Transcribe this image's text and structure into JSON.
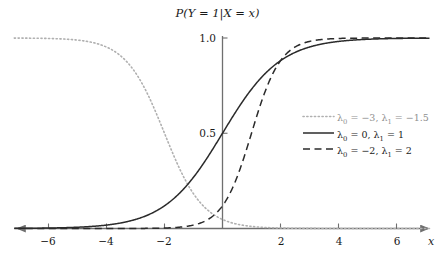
{
  "chart_data": {
    "type": "line",
    "title": "P(Y = 1|X = x)",
    "xlabel": "x",
    "ylabel": "",
    "xlim": [
      -7.2,
      7.2
    ],
    "ylim": [
      0,
      1.0
    ],
    "xticks": [
      -6,
      -4,
      -2,
      2,
      4,
      6
    ],
    "xtick_labels": [
      "−6",
      "−4",
      "−2",
      "2",
      "4",
      "6"
    ],
    "yticks": [
      0.5,
      1.0
    ],
    "ytick_labels": [
      "0.5",
      "1.0"
    ],
    "grid": false,
    "legend_position": "center-right",
    "series": [
      {
        "name": "lambda0 = -3, lambda1 = -1.5",
        "label_l0": "λ",
        "label_l0_sub": "0",
        "label_l0_val": " = −3,",
        "label_l1": "λ",
        "label_l1_sub": "1",
        "label_l1_val": " = −1.5",
        "lambda0": -3,
        "lambda1": -1.5,
        "style": "dotted",
        "color": "#b0b0b0",
        "midpoint_x": -2
      },
      {
        "name": "lambda0 = 0, lambda1 = 1",
        "label_l0": "λ",
        "label_l0_sub": "0",
        "label_l0_val": " = 0,",
        "label_l1": "λ",
        "label_l1_sub": "1",
        "label_l1_val": " = 1",
        "lambda0": 0,
        "lambda1": 1,
        "style": "solid",
        "color": "#2b2b2b",
        "midpoint_x": 0
      },
      {
        "name": "lambda0 = -2, lambda1 = 2",
        "label_l0": "λ",
        "label_l0_sub": "0",
        "label_l0_val": " = −2,",
        "label_l1": "λ",
        "label_l1_sub": "1",
        "label_l1_val": " = 2",
        "lambda0": -2,
        "lambda1": 2,
        "style": "dashed",
        "color": "#2b2b2b",
        "midpoint_x": 1
      }
    ],
    "function": "logistic: P = 1 / (1 + exp(-(lambda0 + lambda1 * x)))",
    "axis_color": "#6f6f6f"
  },
  "title_parts": {
    "p": "P",
    "open": "(",
    "y": "Y",
    "eq1": " = 1",
    "bar": "|",
    "x_upper": "X",
    "eq2": " = ",
    "x_lower": "x",
    "close": ")"
  },
  "axis": {
    "x_label": "x"
  },
  "colors": {
    "axis": "#6f6f6f",
    "curve_dark": "#2b2b2b",
    "curve_light": "#b0b0b0",
    "text": "#1a1a1a",
    "background": "#ffffff"
  }
}
